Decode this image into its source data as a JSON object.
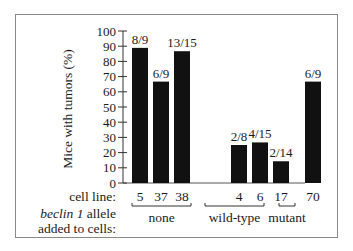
{
  "chart_data": {
    "type": "bar",
    "title": "",
    "ylabel": "Mice with tumors (%)",
    "xlabel": "",
    "ylim": [
      0,
      100
    ],
    "yticks": [
      0,
      10,
      20,
      30,
      40,
      50,
      60,
      70,
      80,
      90,
      100
    ],
    "grid": false,
    "legend": null,
    "categories": [
      "5",
      "37",
      "38",
      "4",
      "6",
      "17",
      "70"
    ],
    "values": [
      88.9,
      66.7,
      86.7,
      25.0,
      26.7,
      14.3,
      66.7
    ],
    "bar_labels": [
      "8/9",
      "6/9",
      "13/15",
      "2/8",
      "4/15",
      "2/14",
      "6/9"
    ],
    "groups": [
      {
        "name": "none",
        "categories": [
          "5",
          "37",
          "38"
        ]
      },
      {
        "name": "wild-type",
        "categories": [
          "4",
          "6",
          "17"
        ]
      },
      {
        "name": "mutant",
        "categories": [
          "70"
        ]
      }
    ],
    "row_labels": {
      "cell_line": "cell line:",
      "allele_line1_italic": "beclin 1",
      "allele_line1_rest": " allele",
      "allele_line2": "added to cells:"
    },
    "bar_color": "#111111"
  }
}
